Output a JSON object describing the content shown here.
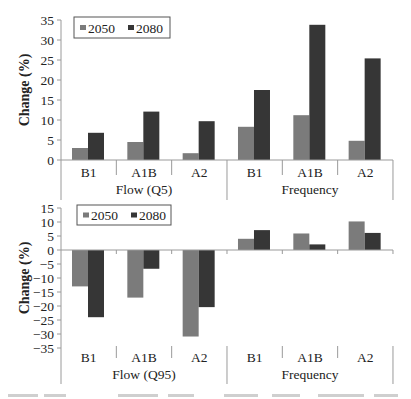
{
  "colors": {
    "series_2050": "#7b7b7b",
    "series_2080": "#363636",
    "axis": "#9a9a9a",
    "text": "#222222"
  },
  "chart_data": [
    {
      "type": "bar",
      "title": "",
      "ylabel": "Change (%)",
      "xlabel": "",
      "ylim": [
        0,
        35
      ],
      "yticks": [
        0,
        5,
        10,
        15,
        20,
        25,
        30,
        35
      ],
      "grid": false,
      "legend_position": "top-left inside",
      "categories": [
        "B1",
        "A1B",
        "A2",
        "B1",
        "A1B",
        "A2"
      ],
      "groups": [
        {
          "label": "Flow (Q5)",
          "categories": [
            "B1",
            "A1B",
            "A2"
          ]
        },
        {
          "label": "Frequency",
          "categories": [
            "B1",
            "A1B",
            "A2"
          ]
        }
      ],
      "series": [
        {
          "name": "2050",
          "values": [
            3.0,
            4.5,
            1.7,
            8.3,
            11.2,
            4.8
          ]
        },
        {
          "name": "2080",
          "values": [
            6.8,
            12.1,
            9.7,
            17.5,
            33.8,
            25.4
          ]
        }
      ]
    },
    {
      "type": "bar",
      "title": "",
      "ylabel": "Change (%)",
      "xlabel": "",
      "ylim": [
        -35,
        15
      ],
      "yticks": [
        15,
        10,
        5,
        0,
        -5,
        -10,
        -15,
        -20,
        -25,
        -30,
        -35
      ],
      "grid": false,
      "legend_position": "top-left inside",
      "categories": [
        "B1",
        "A1B",
        "A2",
        "B1",
        "A1B",
        "A2"
      ],
      "groups": [
        {
          "label": "Flow (Q95)",
          "categories": [
            "B1",
            "A1B",
            "A2"
          ]
        },
        {
          "label": "Frequency",
          "categories": [
            "B1",
            "A1B",
            "A2"
          ]
        }
      ],
      "series": [
        {
          "name": "2050",
          "values": [
            -13.0,
            -17.0,
            -30.9,
            4.0,
            5.9,
            10.2
          ]
        },
        {
          "name": "2080",
          "values": [
            -24.0,
            -6.7,
            -20.4,
            7.1,
            2.0,
            6.1
          ]
        }
      ]
    }
  ]
}
